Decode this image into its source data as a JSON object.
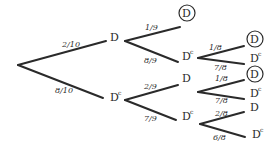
{
  "diagram": {
    "type": "probability-tree",
    "ink_color": "#2a2a2a",
    "background": "#ffffff",
    "nodes": [
      {
        "id": "root",
        "label": "",
        "x": 18,
        "y": 65
      },
      {
        "id": "n1",
        "label": "D",
        "sup": "",
        "circled": false,
        "x": 114,
        "y": 41
      },
      {
        "id": "n2",
        "label": "D",
        "sup": "c",
        "circled": false,
        "x": 114,
        "y": 101
      },
      {
        "id": "n11",
        "label": "D",
        "sup": "",
        "circled": true,
        "x": 186,
        "y": 17
      },
      {
        "id": "n12",
        "label": "D",
        "sup": "c",
        "circled": false,
        "x": 186,
        "y": 60
      },
      {
        "id": "n21",
        "label": "D",
        "sup": "",
        "circled": false,
        "x": 186,
        "y": 82
      },
      {
        "id": "n22",
        "label": "D",
        "sup": "c",
        "circled": false,
        "x": 186,
        "y": 120
      },
      {
        "id": "n121",
        "label": "D",
        "sup": "",
        "circled": true,
        "x": 254,
        "y": 43
      },
      {
        "id": "n122",
        "label": "D",
        "sup": "c",
        "circled": false,
        "x": 254,
        "y": 62
      },
      {
        "id": "n211",
        "label": "D",
        "sup": "",
        "circled": true,
        "x": 254,
        "y": 78
      },
      {
        "id": "n212",
        "label": "D",
        "sup": "c",
        "circled": false,
        "x": 254,
        "y": 97
      },
      {
        "id": "n221",
        "label": "D",
        "sup": "",
        "circled": false,
        "x": 254,
        "y": 111
      },
      {
        "id": "n222",
        "label": "D",
        "sup": "c",
        "circled": false,
        "x": 256,
        "y": 138
      }
    ],
    "edges": [
      {
        "from": "root",
        "to": "n1",
        "prob": "2/10",
        "x1": 18,
        "y1": 65,
        "x2": 106,
        "y2": 41,
        "lx": 62,
        "ly": 47
      },
      {
        "from": "root",
        "to": "n2",
        "prob": "8/10",
        "x1": 18,
        "y1": 65,
        "x2": 103,
        "y2": 98,
        "lx": 55,
        "ly": 93
      },
      {
        "from": "n1",
        "to": "n11",
        "prob": "1/9",
        "x1": 125,
        "y1": 41,
        "x2": 180,
        "y2": 27,
        "lx": 145,
        "ly": 30
      },
      {
        "from": "n1",
        "to": "n12",
        "prob": "8/9",
        "x1": 125,
        "y1": 41,
        "x2": 178,
        "y2": 62,
        "lx": 144,
        "ly": 63
      },
      {
        "from": "n2",
        "to": "n21",
        "prob": "2/9",
        "x1": 125,
        "y1": 100,
        "x2": 178,
        "y2": 85,
        "lx": 144,
        "ly": 89
      },
      {
        "from": "n2",
        "to": "n22",
        "prob": "7/9",
        "x1": 125,
        "y1": 100,
        "x2": 176,
        "y2": 120,
        "lx": 144,
        "ly": 121
      },
      {
        "from": "n12",
        "to": "n121",
        "prob": "1/8",
        "x1": 198,
        "y1": 58,
        "x2": 244,
        "y2": 46,
        "lx": 209,
        "ly": 50
      },
      {
        "from": "n12",
        "to": "n122",
        "prob": "7/8",
        "x1": 198,
        "y1": 58,
        "x2": 244,
        "y2": 64,
        "lx": 214,
        "ly": 70
      },
      {
        "from": "n21",
        "to": "n211",
        "prob": "1/8",
        "x1": 198,
        "y1": 92,
        "x2": 244,
        "y2": 80,
        "lx": 215,
        "ly": 81
      },
      {
        "from": "n21",
        "to": "n212",
        "prob": "7/8",
        "x1": 198,
        "y1": 92,
        "x2": 244,
        "y2": 99,
        "lx": 215,
        "ly": 103
      },
      {
        "from": "n22",
        "to": "n221",
        "prob": "2/8",
        "x1": 200,
        "y1": 124,
        "x2": 244,
        "y2": 112,
        "lx": 215,
        "ly": 116
      },
      {
        "from": "n22",
        "to": "n222",
        "prob": "6/8",
        "x1": 200,
        "y1": 124,
        "x2": 245,
        "y2": 137,
        "lx": 213,
        "ly": 140
      }
    ]
  }
}
